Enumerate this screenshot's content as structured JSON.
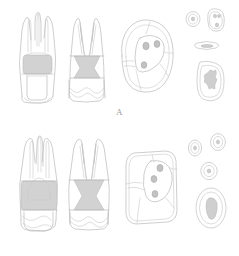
{
  "figure": {
    "background_color": "#ffffff",
    "line_color": "#b9b9b9",
    "pulp_fill_color": "#d2d2d2",
    "label_color": "#9b9b9b",
    "width": 239,
    "height": 256
  },
  "panels": [
    {
      "id": "A",
      "label": "A",
      "views": [
        {
          "name": "buccal-view",
          "description": "Buccal longitudinal section of molar showing three root canals converging into pulp chamber",
          "canal_count": 3,
          "root_count": 3
        },
        {
          "name": "proximal-view",
          "description": "Proximal longitudinal section showing two widely divergent roots and shaded pulp chamber",
          "canal_count": 2,
          "root_count": 2
        },
        {
          "name": "occlusal-view",
          "description": "Occlusal view of pulp chamber floor with triangular arrangement of canal orifices",
          "orifice_count": 3
        },
        {
          "name": "cross-sections",
          "description": "Root cross sections at successive apical levels",
          "sections": [
            {
              "name": "cross-section-small-round",
              "shape": "round",
              "canal_count": 1
            },
            {
              "name": "cross-section-hourglass",
              "shape": "hourglass",
              "canal_count": 2
            },
            {
              "name": "cross-section-ribbon",
              "shape": "flattened-ribbon",
              "canal_count": 1
            },
            {
              "name": "cross-section-large-rounded-rect",
              "shape": "rounded-rectangle",
              "canal_count": 1
            }
          ]
        }
      ]
    },
    {
      "id": "B",
      "label": "B",
      "views": [
        {
          "name": "buccal-view",
          "description": "Buccal longitudinal section of molar with broad shaded pulp chamber",
          "canal_count": 3,
          "root_count": 3
        },
        {
          "name": "proximal-view",
          "description": "Proximal longitudinal section with large shaded pulp chamber and divergent roots",
          "canal_count": 2,
          "root_count": 2
        },
        {
          "name": "occlusal-view",
          "description": "Occlusal view with rectangular outline and three canal orifices",
          "orifice_count": 3
        },
        {
          "name": "cross-sections",
          "description": "Root cross sections at successive apical levels",
          "sections": [
            {
              "name": "cross-section-small-oval-left",
              "shape": "oval",
              "canal_count": 1
            },
            {
              "name": "cross-section-small-oval-right",
              "shape": "oval",
              "canal_count": 1
            },
            {
              "name": "cross-section-round-mid",
              "shape": "round",
              "canal_count": 1
            },
            {
              "name": "cross-section-large-oval",
              "shape": "large-oval",
              "canal_count": 1
            }
          ]
        }
      ]
    }
  ]
}
